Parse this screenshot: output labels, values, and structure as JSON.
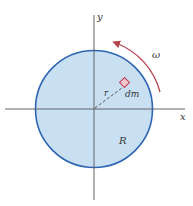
{
  "diagram": {
    "axes": {
      "x_label": "x",
      "y_label": "y"
    },
    "disk": {
      "label": "R",
      "fill_color": "#c9dff2",
      "stroke_color": "#2f66b3"
    },
    "mass_element": {
      "label": "dm",
      "fill_color": "#f4c6cf",
      "stroke_color": "#c0394f"
    },
    "radius_line": {
      "label": "r"
    },
    "rotation": {
      "label": "ω",
      "arrow_color": "#b8454f"
    },
    "colors": {
      "axis": "#555555",
      "text": "#333333"
    }
  }
}
